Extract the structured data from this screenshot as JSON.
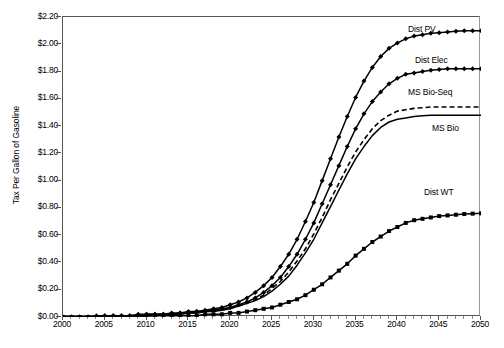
{
  "chart_data": {
    "type": "line",
    "title": "",
    "xlabel": "",
    "ylabel": "Tax Per Gallon of Gasoline",
    "xlim": [
      2000,
      2050
    ],
    "ylim": [
      0.0,
      2.2
    ],
    "ytick_step": 0.2,
    "xtick_step": 5,
    "xminor_step": 1,
    "grid": false,
    "legend_position": "inline-annotations",
    "ytick_labels": [
      "$0.00",
      "$0.20",
      "$0.40",
      "$0.60",
      "$0.80",
      "$1.00",
      "$1.20",
      "$1.40",
      "$1.60",
      "$1.80",
      "$2.00",
      "$2.20"
    ],
    "ytick_values": [
      0.0,
      0.2,
      0.4,
      0.6,
      0.8,
      1.0,
      1.2,
      1.4,
      1.6,
      1.8,
      2.0,
      2.2
    ],
    "xtick_labels": [
      "2000",
      "2005",
      "2010",
      "2015",
      "2020",
      "2025",
      "2030",
      "2035",
      "2040",
      "2045",
      "2050"
    ],
    "xtick_values": [
      2000,
      2005,
      2010,
      2015,
      2020,
      2025,
      2030,
      2035,
      2040,
      2045,
      2050
    ],
    "x": [
      2000,
      2001,
      2002,
      2003,
      2004,
      2005,
      2006,
      2007,
      2008,
      2009,
      2010,
      2011,
      2012,
      2013,
      2014,
      2015,
      2016,
      2017,
      2018,
      2019,
      2020,
      2021,
      2022,
      2023,
      2024,
      2025,
      2026,
      2027,
      2028,
      2029,
      2030,
      2031,
      2032,
      2033,
      2034,
      2035,
      2036,
      2037,
      2038,
      2039,
      2040,
      2041,
      2042,
      2043,
      2044,
      2045,
      2046,
      2047,
      2048,
      2049,
      2050
    ],
    "series": [
      {
        "name": "Dist PV",
        "label": "Dist PV",
        "style": "solid",
        "marker": "diamond",
        "end_value": 2.1,
        "values": [
          0.0,
          0.0,
          0.0,
          0.0,
          0.01,
          0.01,
          0.01,
          0.01,
          0.01,
          0.02,
          0.02,
          0.02,
          0.02,
          0.03,
          0.03,
          0.04,
          0.04,
          0.05,
          0.06,
          0.07,
          0.09,
          0.11,
          0.14,
          0.18,
          0.23,
          0.29,
          0.37,
          0.46,
          0.57,
          0.7,
          0.84,
          1.0,
          1.16,
          1.32,
          1.47,
          1.61,
          1.73,
          1.83,
          1.91,
          1.97,
          2.01,
          2.04,
          2.06,
          2.07,
          2.08,
          2.085,
          2.09,
          2.095,
          2.1,
          2.1,
          2.1
        ]
      },
      {
        "name": "Dist Elec",
        "label": "Dist Elec",
        "style": "solid",
        "marker": "diamond",
        "end_value": 1.82,
        "values": [
          0.0,
          0.0,
          0.0,
          0.0,
          0.0,
          0.01,
          0.01,
          0.01,
          0.01,
          0.01,
          0.02,
          0.02,
          0.02,
          0.02,
          0.03,
          0.03,
          0.04,
          0.04,
          0.05,
          0.06,
          0.07,
          0.09,
          0.11,
          0.14,
          0.18,
          0.23,
          0.29,
          0.37,
          0.46,
          0.57,
          0.69,
          0.83,
          0.97,
          1.11,
          1.25,
          1.38,
          1.49,
          1.58,
          1.65,
          1.71,
          1.75,
          1.78,
          1.79,
          1.8,
          1.81,
          1.815,
          1.82,
          1.82,
          1.82,
          1.82,
          1.82
        ]
      },
      {
        "name": "MS Bio-Seq",
        "label": "MS Bio-Seq",
        "style": "dashed",
        "marker": "none",
        "end_value": 1.54,
        "values": [
          0.0,
          0.0,
          0.0,
          0.0,
          0.0,
          0.0,
          0.01,
          0.01,
          0.01,
          0.01,
          0.01,
          0.02,
          0.02,
          0.02,
          0.02,
          0.03,
          0.03,
          0.04,
          0.05,
          0.05,
          0.07,
          0.08,
          0.1,
          0.13,
          0.16,
          0.21,
          0.26,
          0.33,
          0.41,
          0.5,
          0.61,
          0.73,
          0.86,
          0.98,
          1.1,
          1.21,
          1.3,
          1.38,
          1.44,
          1.48,
          1.51,
          1.52,
          1.53,
          1.535,
          1.54,
          1.54,
          1.54,
          1.54,
          1.54,
          1.54,
          1.54
        ]
      },
      {
        "name": "MS Bio",
        "label": "MS Bio",
        "style": "solid",
        "marker": "none",
        "end_value": 1.48,
        "values": [
          0.0,
          0.0,
          0.0,
          0.0,
          0.0,
          0.0,
          0.0,
          0.01,
          0.01,
          0.01,
          0.01,
          0.01,
          0.02,
          0.02,
          0.02,
          0.03,
          0.03,
          0.04,
          0.04,
          0.05,
          0.06,
          0.08,
          0.1,
          0.12,
          0.15,
          0.19,
          0.24,
          0.3,
          0.38,
          0.47,
          0.57,
          0.69,
          0.81,
          0.93,
          1.05,
          1.16,
          1.25,
          1.33,
          1.39,
          1.43,
          1.45,
          1.46,
          1.47,
          1.475,
          1.48,
          1.48,
          1.48,
          1.48,
          1.48,
          1.48,
          1.48
        ]
      },
      {
        "name": "Dist WT",
        "label": "Dist WT",
        "style": "solid",
        "marker": "square",
        "end_value": 0.76,
        "values": [
          0.0,
          0.0,
          0.0,
          0.0,
          0.0,
          0.0,
          0.0,
          0.0,
          0.0,
          0.0,
          0.01,
          0.01,
          0.01,
          0.01,
          0.01,
          0.01,
          0.01,
          0.02,
          0.02,
          0.02,
          0.03,
          0.03,
          0.04,
          0.05,
          0.06,
          0.07,
          0.09,
          0.11,
          0.13,
          0.16,
          0.2,
          0.24,
          0.29,
          0.34,
          0.39,
          0.45,
          0.5,
          0.55,
          0.59,
          0.63,
          0.66,
          0.69,
          0.71,
          0.72,
          0.73,
          0.74,
          0.745,
          0.75,
          0.755,
          0.758,
          0.76
        ]
      }
    ],
    "annotations": [
      {
        "text": "Dist PV",
        "x_px": 408,
        "y_px": 25
      },
      {
        "text": "Dist Elec",
        "x_px": 415,
        "y_px": 56
      },
      {
        "text": "MS Bio-Seq",
        "x_px": 408,
        "y_px": 88
      },
      {
        "text": "MS Bio",
        "x_px": 432,
        "y_px": 124
      },
      {
        "text": "Dist WT",
        "x_px": 424,
        "y_px": 188
      }
    ]
  },
  "colors": {
    "series": "#000000",
    "axis": "#555555",
    "background": "#ffffff"
  }
}
